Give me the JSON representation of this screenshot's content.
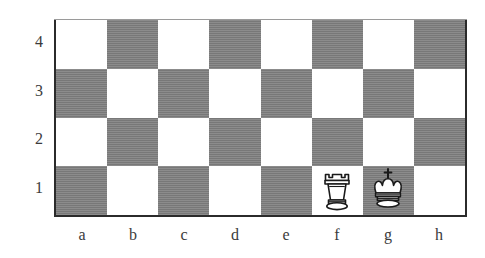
{
  "diagram": {
    "kind": "chess-board-diagram",
    "files_shown": [
      "a",
      "b",
      "c",
      "d",
      "e",
      "f",
      "g",
      "h"
    ],
    "ranks_shown": [
      "4",
      "3",
      "2",
      "1"
    ],
    "colors": {
      "light_square": "#ffffff",
      "dark_square": "#7f7f7f",
      "border": "#2b2b2b",
      "label_text": "#3b3b3b",
      "piece_outline": "#1a1a1a",
      "piece_fill": "#ffffff"
    },
    "squares": [
      {
        "id": "a4",
        "shade": "light"
      },
      {
        "id": "b4",
        "shade": "dark"
      },
      {
        "id": "c4",
        "shade": "light"
      },
      {
        "id": "d4",
        "shade": "dark"
      },
      {
        "id": "e4",
        "shade": "light"
      },
      {
        "id": "f4",
        "shade": "dark"
      },
      {
        "id": "g4",
        "shade": "light"
      },
      {
        "id": "h4",
        "shade": "dark"
      },
      {
        "id": "a3",
        "shade": "dark"
      },
      {
        "id": "b3",
        "shade": "light"
      },
      {
        "id": "c3",
        "shade": "dark"
      },
      {
        "id": "d3",
        "shade": "light"
      },
      {
        "id": "e3",
        "shade": "dark"
      },
      {
        "id": "f3",
        "shade": "light"
      },
      {
        "id": "g3",
        "shade": "dark"
      },
      {
        "id": "h3",
        "shade": "light"
      },
      {
        "id": "a2",
        "shade": "light"
      },
      {
        "id": "b2",
        "shade": "dark"
      },
      {
        "id": "c2",
        "shade": "light"
      },
      {
        "id": "d2",
        "shade": "dark"
      },
      {
        "id": "e2",
        "shade": "light"
      },
      {
        "id": "f2",
        "shade": "dark"
      },
      {
        "id": "g2",
        "shade": "light"
      },
      {
        "id": "h2",
        "shade": "dark"
      },
      {
        "id": "a1",
        "shade": "dark"
      },
      {
        "id": "b1",
        "shade": "light"
      },
      {
        "id": "c1",
        "shade": "dark"
      },
      {
        "id": "d1",
        "shade": "light"
      },
      {
        "id": "e1",
        "shade": "dark"
      },
      {
        "id": "f1",
        "shade": "light"
      },
      {
        "id": "g1",
        "shade": "dark"
      },
      {
        "id": "h1",
        "shade": "light"
      }
    ],
    "pieces": [
      {
        "square": "f1",
        "color": "white",
        "type": "rook",
        "glyph": "white-rook-icon"
      },
      {
        "square": "g1",
        "color": "white",
        "type": "king",
        "glyph": "white-king-icon"
      }
    ],
    "rank_labels": [
      {
        "text": "4",
        "top": 33
      },
      {
        "text": "3",
        "top": 82
      },
      {
        "text": "2",
        "top": 130
      },
      {
        "text": "1",
        "top": 179
      }
    ],
    "file_labels": [
      {
        "text": "a",
        "left": 67
      },
      {
        "text": "b",
        "left": 118
      },
      {
        "text": "c",
        "left": 169
      },
      {
        "text": "d",
        "left": 220
      },
      {
        "text": "e",
        "left": 271
      },
      {
        "text": "f",
        "left": 322
      },
      {
        "text": "g",
        "left": 373
      },
      {
        "text": "h",
        "left": 424
      }
    ]
  }
}
